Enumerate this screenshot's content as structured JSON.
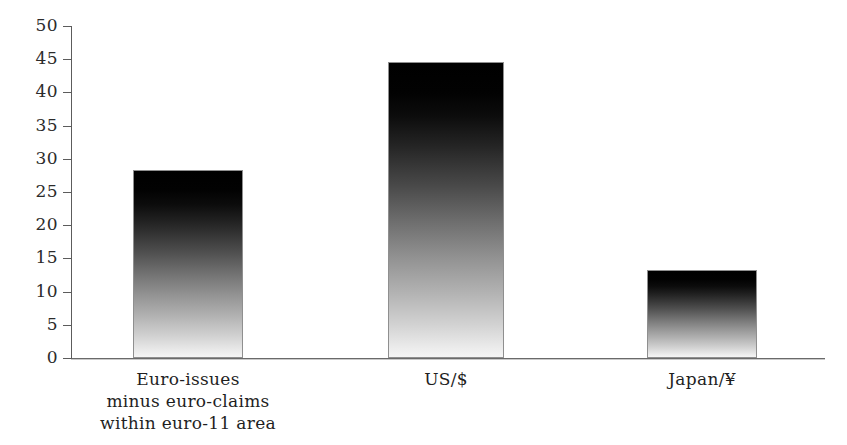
{
  "chart_data": {
    "type": "bar",
    "title": "",
    "subtitle": "",
    "xlabel": "",
    "ylabel": "",
    "categories": [
      "Euro-issues\nminus euro-claims\nwithin euro-11 area",
      "US/$",
      "Japan/¥"
    ],
    "category_lines": [
      [
        "Euro-issues",
        "minus euro-claims",
        "within euro-11 area"
      ],
      [
        "US/$"
      ],
      [
        "Japan/¥"
      ]
    ],
    "values": [
      28.3,
      44.6,
      13.2
    ],
    "ylim": [
      0,
      50
    ],
    "ytick_values": [
      0,
      5,
      10,
      15,
      20,
      25,
      30,
      35,
      40,
      45,
      50
    ],
    "ytick_labels": [
      "0",
      "5",
      "10",
      "15",
      "20",
      "25",
      "30",
      "35",
      "40",
      "45",
      "50"
    ],
    "grid": false,
    "legend": null,
    "annotations": [],
    "colors": {
      "bar_top": "#000000",
      "bar_bottom": "#f5f5f5",
      "bar_border": "#8f8f8f",
      "axis": "#5c5c5c",
      "text": "#1f1f1f",
      "background": "#ffffff"
    }
  },
  "geometry": {
    "plot_left": 71,
    "plot_baseline_y": 358,
    "plot_top_y": 26,
    "px_per_unit": 6.64,
    "axis_right": 825,
    "bars": [
      {
        "left": 133,
        "width": 110
      },
      {
        "left": 388,
        "width": 116
      },
      {
        "left": 647,
        "width": 110
      }
    ],
    "label_centers": [
      188,
      446,
      702
    ]
  }
}
